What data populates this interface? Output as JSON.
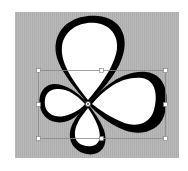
{
  "canvas": {
    "background_color": "#b5b5b5",
    "bounds": {
      "x": 15,
      "y": 12,
      "width": 164,
      "height": 146
    }
  },
  "shape": {
    "name": "four-leaf-clover",
    "fill_color": "#ffffff",
    "stroke_color": "#000000",
    "leaves": [
      "top",
      "right",
      "bottom",
      "left"
    ]
  },
  "selection": {
    "bounding_box": {
      "x": 38,
      "y": 70,
      "width": 127,
      "height": 68
    },
    "stroke_color": "#8a8a8a",
    "handle_color": "#ffffff",
    "handles": [
      "top-left",
      "top-middle",
      "top-right",
      "middle-left",
      "middle-right",
      "bottom-left",
      "bottom-middle",
      "bottom-right"
    ],
    "pivot": {
      "x": 88,
      "y": 104
    }
  }
}
